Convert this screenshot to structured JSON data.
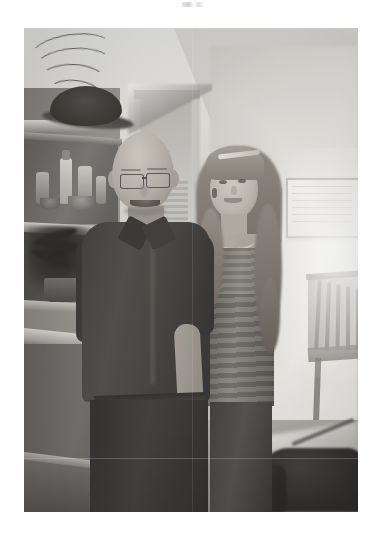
{
  "page": {
    "background_color": "#ffffff",
    "width": 382,
    "height": 536,
    "top_artifact_label": ""
  },
  "photograph": {
    "kind": "scanned-photo-print",
    "description": "Black and white indoor snapshot of an older bald man wearing glasses standing beside a tall young woman with long wavy hair in a strapless ruched dress",
    "tone": "grayscale",
    "position": {
      "left": 24,
      "top": 28,
      "width": 334,
      "height": 484
    },
    "border_color": "#ffffff",
    "colors": {
      "wall_light": "#e8e8e6",
      "wall_mid": "#cfcdc8",
      "wall_shadow": "#a09e99",
      "shelf_wood": "#8c8a85",
      "shelf_shadow": "#5a5855",
      "dark_shirt": "#3a3835",
      "dark_trousers": "#2b2927",
      "skin_light": "#cfc9c0",
      "skin_mid": "#b3ada4",
      "dress_light": "#89857f",
      "dress_dark": "#5e5a55",
      "hair": "#7b756d",
      "hat_black": "#2b2926",
      "bag_black": "#201e1c",
      "floor": "#9b9994",
      "highlight_blowout": "#ffffff"
    },
    "subjects": [
      {
        "id": "man",
        "label": "Older man",
        "details": "Bald, wire-rim glasses, smiling, dark short-sleeve button shirt, dark trousers, right arm hanging at his side",
        "position": "left of center"
      },
      {
        "id": "young-woman",
        "label": "Young woman",
        "details": "Long wavy light hair, headband, drop earring, necklace, strapless ruched dress, dark lower skirt",
        "position": "right of center"
      }
    ],
    "scene_objects": [
      {
        "id": "hat",
        "label": "Dark hat on top shelf"
      },
      {
        "id": "shelf-unit",
        "label": "Wooden shelving unit with bottles and bowls"
      },
      {
        "id": "potted-plant",
        "label": "Dark potted plant on lower shelf"
      },
      {
        "id": "counter",
        "label": "Cabinet counter top"
      },
      {
        "id": "doorway",
        "label": "Open doorway behind the pair"
      },
      {
        "id": "window-blinds",
        "label": "Window blinds seen through doorway"
      },
      {
        "id": "framed-art-large",
        "label": "Large framed print on right wall"
      },
      {
        "id": "framed-art-small",
        "label": "Small framed picture on right wall"
      },
      {
        "id": "wooden-chair",
        "label": "Spindle-back wooden chair"
      },
      {
        "id": "floor-bag",
        "label": "Dark bag on the floor"
      },
      {
        "id": "palm-fronds",
        "label": "Palm fronds at upper left"
      },
      {
        "id": "window-glare",
        "label": "Blown-out window glare on right wall"
      }
    ]
  }
}
